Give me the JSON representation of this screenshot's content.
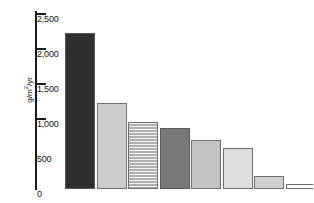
{
  "chart_data": {
    "type": "bar",
    "title": "",
    "xlabel": "",
    "ylabel": "g/m2/yr",
    "ylabel_display": "g/m",
    "ylabel_exponent": "2",
    "ylabel_suffix": "/yr",
    "ylim": [
      0,
      2500
    ],
    "grid": false,
    "legend": "none",
    "categories": [
      "1",
      "2",
      "3",
      "4",
      "5",
      "6",
      "7",
      "8"
    ],
    "values": [
      2230,
      1230,
      960,
      870,
      700,
      585,
      185,
      70
    ],
    "tick_labels": [
      "2,500",
      "2,000",
      "1,500",
      "1,000",
      "500",
      "0"
    ],
    "tick_values": [
      2500,
      2000,
      1500,
      1000,
      500,
      0
    ],
    "ticks_marked": [
      2500,
      2000,
      1500,
      1000
    ],
    "bars": [
      {
        "value": 2230,
        "fill": "#2e2e2e",
        "pattern": "solid",
        "border": "#555555"
      },
      {
        "value": 1230,
        "fill": "#cccccc",
        "pattern": "solid",
        "border": "#6d6d6d"
      },
      {
        "value": 960,
        "fill": "#b0b0b0",
        "pattern": "horizontal",
        "border": "#6d6d6d"
      },
      {
        "value": 870,
        "fill": "#787878",
        "pattern": "solid",
        "border": "#5a5a5a"
      },
      {
        "value": 700,
        "fill": "#c4c4c4",
        "pattern": "solid",
        "border": "#6d6d6d"
      },
      {
        "value": 585,
        "fill": "#dedede",
        "pattern": "solid",
        "border": "#6d6d6d"
      },
      {
        "value": 185,
        "fill": "#cfcfcf",
        "pattern": "solid",
        "border": "#6d6d6d"
      },
      {
        "value": 70,
        "fill": "#fbfbfb",
        "pattern": "solid",
        "border": "#6d6d6d"
      }
    ],
    "colors": {
      "axis": "#1a1a1a",
      "text": "#111111",
      "background": "#ffffff"
    }
  }
}
